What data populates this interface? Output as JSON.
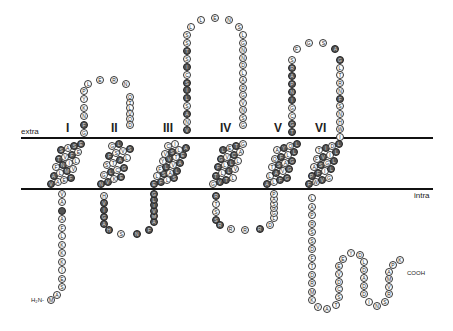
{
  "labels": {
    "extra": "extra",
    "intra": "intra",
    "n_terminus": "H₂N-",
    "c_terminus": "COOH"
  },
  "transmembrane_helices": [
    "I",
    "II",
    "III",
    "IV",
    "V",
    "VI"
  ],
  "colors": {
    "membrane_line": "#111111",
    "hydrophobic_residue": "#555555",
    "polar_residue": "#ffffff"
  },
  "segments": {
    "n_tail": {
      "seq": [
        "M",
        "A",
        "S",
        "E",
        "I",
        "K",
        "K",
        "K",
        "L",
        "F",
        "A",
        "",
        "A",
        "V"
      ],
      "dark": [
        11
      ]
    },
    "tm1": {
      "seq": [
        "V",
        "A",
        "E",
        "F",
        "A",
        "L",
        "M",
        "V",
        "F",
        "N",
        "I",
        "L",
        "T",
        "V",
        "F",
        "E",
        "S",
        "A",
        "S",
        "E"
      ],
      "dark": [
        0,
        3,
        4,
        6,
        9,
        12,
        14,
        16,
        18,
        19
      ]
    },
    "loop_1_2": {
      "seq": [
        "G",
        "F",
        "N",
        "K",
        "Y",
        "P",
        "L",
        "E",
        "R",
        "N",
        "Q",
        "T",
        "L",
        "V",
        "Q",
        "D"
      ],
      "dark": [
        1
      ]
    },
    "tm2": {
      "seq": [
        "N",
        "V",
        "K",
        "E",
        "G",
        "L",
        "C",
        "G",
        "S",
        "T",
        "A",
        "L",
        "F",
        "S",
        "V",
        "S",
        "G",
        "L"
      ],
      "dark": [
        0,
        1,
        3,
        5,
        7,
        10,
        12,
        15,
        17
      ]
    },
    "loop_2_3": {
      "seq": [
        "H",
        "V",
        "I",
        "G",
        "A",
        "H",
        "S",
        "N",
        "F",
        "A",
        "M",
        "V",
        "T",
        "L",
        "G"
      ],
      "dark": [
        1,
        2,
        3,
        4,
        5,
        7,
        8,
        9,
        10,
        11,
        12,
        13,
        14
      ]
    },
    "tm3": {
      "seq": [
        "E",
        "F",
        "L",
        "S",
        "L",
        "S",
        "A",
        "L",
        "F",
        "L",
        "V",
        "A",
        "Y",
        "V",
        "T",
        "E",
        "V",
        "S",
        "L",
        "A",
        "C",
        "I"
      ],
      "dark": [
        0,
        1,
        3,
        5,
        7,
        9,
        11,
        13,
        15,
        17,
        19
      ]
    },
    "loop_3_4": {
      "seq": [
        "V",
        "N",
        "A",
        "S",
        "L",
        "I",
        "S",
        "C",
        "I",
        "S",
        "T",
        "S",
        "S",
        "L",
        "L",
        "E",
        "N",
        "S",
        "L",
        "G",
        "N",
        "N",
        "D",
        "L",
        "A",
        "R",
        "G",
        "V",
        "N",
        "S",
        "G"
      ],
      "dark": [
        0,
        2,
        4,
        5,
        6,
        8,
        10
      ]
    },
    "tm4": {
      "seq": [
        "G",
        "V",
        "T",
        "L",
        "T",
        "L",
        "L",
        "V",
        "F",
        "L",
        "L",
        "L",
        "G",
        "V",
        "C",
        "A",
        "L",
        "E",
        "T",
        "G"
      ],
      "dark": [
        1,
        2,
        4,
        6,
        8,
        10,
        12,
        14,
        16,
        18
      ]
    },
    "loop_4_5": {
      "seq": [
        "R",
        "T",
        "S",
        "S",
        "R",
        "R",
        "R",
        "R",
        "D",
        "L",
        "G",
        "G",
        "S",
        "A",
        "P"
      ],
      "dark": [
        0,
        3,
        4,
        7
      ]
    },
    "tm5": {
      "seq": [
        "A",
        "L",
        "F",
        "G",
        "L",
        "A",
        "V",
        "G",
        "T",
        "S",
        "A",
        "G",
        "Q",
        "F",
        "L",
        "L",
        "A",
        "Y",
        "Q",
        "L"
      ],
      "dark": [
        0,
        2,
        3,
        5,
        7,
        9,
        11,
        13,
        15,
        17,
        19
      ]
    },
    "loop_5_6": {
      "seq": [
        "T",
        "G",
        "C",
        "G",
        "I",
        "N",
        "P",
        "A",
        "R",
        "S",
        "F",
        "G",
        "S",
        "A",
        "G",
        "L",
        "T",
        "R",
        "N",
        "F",
        "S",
        "N",
        "H",
        "W",
        "I"
      ],
      "dark": [
        0,
        1,
        4,
        5,
        6,
        7,
        8,
        13,
        14,
        19
      ]
    },
    "tm6": {
      "seq": [
        "F",
        "W",
        "V",
        "G",
        "P",
        "F",
        "I",
        "L",
        "A",
        "S",
        "G",
        "L",
        "F",
        "V",
        "I",
        "L",
        "T",
        "I",
        "D",
        "L"
      ],
      "dark": [
        0,
        2,
        4,
        5,
        7,
        9,
        11,
        13,
        15,
        17,
        19
      ]
    },
    "c_tail": {
      "seq": [
        "L",
        "A",
        "P",
        "R",
        "S",
        "S",
        "D",
        "F",
        "T",
        "D",
        "R",
        "M",
        "K",
        "V",
        "A",
        "T",
        "S",
        "C",
        "D",
        "V",
        "E",
        "E",
        "Y",
        "D",
        "L",
        "D",
        "A",
        "D",
        "D",
        "I",
        "N",
        "S",
        "R",
        "V",
        "M",
        "A",
        "P",
        "K"
      ],
      "dark": []
    }
  }
}
